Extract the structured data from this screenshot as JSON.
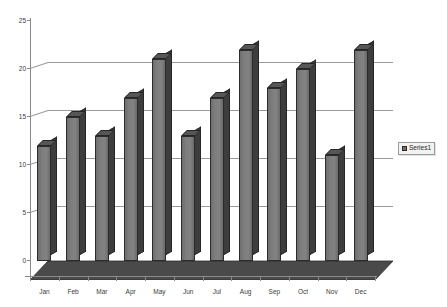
{
  "chart_data": {
    "type": "bar",
    "title": "",
    "subtitle": "",
    "xlabel": "",
    "ylabel": "",
    "categories": [
      "Jan",
      "Feb",
      "Mar",
      "Apr",
      "May",
      "Jun",
      "Jul",
      "Aug",
      "Sep",
      "Oct",
      "Nov",
      "Dec"
    ],
    "series": [
      {
        "name": "Series1",
        "values": [
          12,
          15,
          13,
          17,
          21,
          13,
          17,
          22,
          18,
          20,
          11,
          22
        ]
      }
    ],
    "ylim": [
      0,
      25
    ],
    "yticks": [
      0,
      5,
      10,
      15,
      20,
      25
    ],
    "ytick_labels": [
      "0",
      "5",
      "10",
      "15",
      "20",
      "25"
    ],
    "grid": true,
    "grid_axis": "y",
    "legend": {
      "visible": true,
      "position": "right",
      "entries": [
        "Series1"
      ]
    },
    "style": {
      "three_d": true,
      "bar_face_color": "#7e7e7e",
      "bar_side_color": "#3d3d3d",
      "bar_top_color": "#565656",
      "bar_outline_color": "#2b2b2b",
      "grid_color": "#9a9a9a",
      "axis_color": "#8a8a8a",
      "floor_color": "#4a4a4a",
      "background_color": "#ffffff",
      "text_color": "#3a3a3a"
    }
  }
}
